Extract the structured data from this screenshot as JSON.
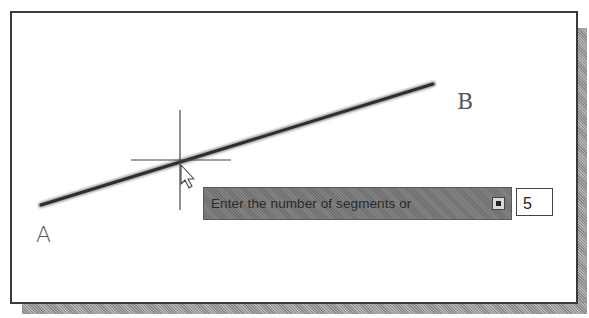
{
  "canvas": {
    "points": [
      {
        "label": "A",
        "x": 41,
        "y": 205
      },
      {
        "label": "B",
        "x": 433,
        "y": 84
      }
    ],
    "crosshair": {
      "x": 180,
      "y": 160
    },
    "cursor": "arrow-pointer"
  },
  "dynamic_input": {
    "prompt": "Enter the number of segments or",
    "options_icon": "dropdown-arrow-icon",
    "value": "5"
  },
  "colors": {
    "line": "#3a3a3a",
    "prompt_bg": "#7a7a7a",
    "frame": "#3a3a3a"
  }
}
